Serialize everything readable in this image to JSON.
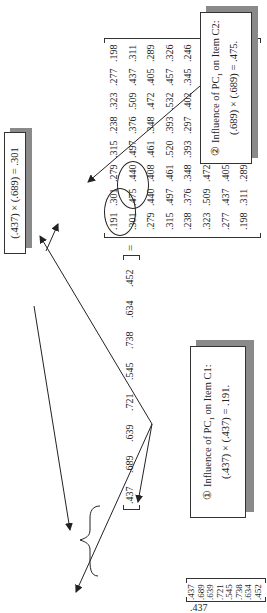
{
  "figure": {
    "column_vector": [
      ".437",
      ".689",
      ".639",
      ".721",
      ".545",
      ".738",
      ".634",
      ".452"
    ],
    "row_vector": [
      ".437",
      ".689",
      ".639",
      ".721",
      ".545",
      ".738",
      ".634",
      ".452"
    ],
    "equals_sign": "=",
    "matrix": [
      [
        ".191",
        ".301",
        ".279",
        ".315",
        ".238",
        ".323",
        ".277",
        ".198"
      ],
      [
        ".301",
        ".475",
        ".440",
        ".497",
        ".376",
        ".509",
        ".437",
        ".311"
      ],
      [
        ".279",
        ".440",
        ".408",
        ".461",
        ".348",
        ".472",
        ".405",
        ".289"
      ],
      [
        ".315",
        ".497",
        ".461",
        ".520",
        ".393",
        ".532",
        ".457",
        ".326"
      ],
      [
        ".238",
        ".376",
        ".348",
        ".393",
        ".297",
        ".402",
        ".345",
        ".246"
      ],
      [
        ".323",
        ".509",
        ".472",
        ".532",
        ".402",
        ".545",
        ".468",
        ".334"
      ],
      [
        ".277",
        ".437",
        ".405",
        ".457",
        ".345",
        ".468",
        ".402",
        ".287"
      ],
      [
        ".198",
        ".311",
        ".289",
        ".326",
        ".246",
        ".334",
        ".287",
        ".204"
      ]
    ],
    "callouts": {
      "product_301": {
        "text": "(.437) × (.689) = .301"
      },
      "item_c1": {
        "marker": "①",
        "line1_prefix": "Influence of PC",
        "line1_sub": "1",
        "line1_suffix": " on Item C1:",
        "line2": "(.437) × (.437) = .191."
      },
      "item_c2": {
        "marker": "②",
        "line1_prefix": "Influence of PC",
        "line1_sub": "1",
        "line1_suffix": " on Item C2:",
        "line2": "(.689) × (.689) = .475."
      }
    },
    "colors": {
      "ink": "#222222",
      "shadow": "#8a8a8a",
      "background": "#ffffff"
    }
  }
}
